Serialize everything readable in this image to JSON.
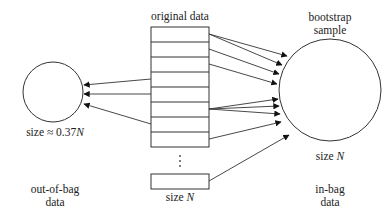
{
  "diagram": {
    "type": "bootstrap-sampling",
    "original_data": {
      "label": "original data",
      "size_label": "size",
      "size_var": "N",
      "rows": 8,
      "ellipsis": "⋮"
    },
    "bootstrap_sample": {
      "label_line1": "bootstrap",
      "label_line2": "sample",
      "size_label": "size",
      "size_var": "N",
      "caption_line1": "in-bag",
      "caption_line2": "data"
    },
    "out_of_bag": {
      "size_label": "size ≈ 0.37",
      "size_var": "N",
      "caption_line1": "out-of-bag",
      "caption_line2": "data"
    },
    "colors": {
      "stroke": "#333333",
      "background": "#ffffff"
    }
  }
}
